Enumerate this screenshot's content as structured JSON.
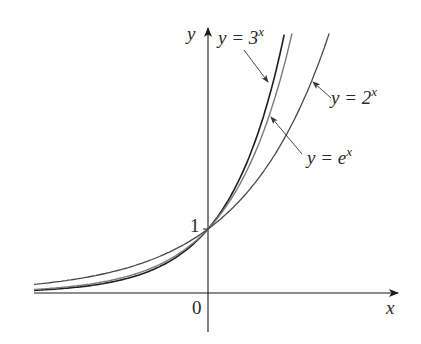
{
  "chart_data": {
    "type": "line",
    "title": "",
    "xlabel": "x",
    "ylabel": "y",
    "grid": false,
    "legend": "inline annotations with arrows",
    "tick_labels": {
      "x": [
        "0"
      ],
      "y": [
        "1"
      ]
    },
    "xlim": [
      -2.9,
      3.15
    ],
    "ylim": [
      -0.6,
      4.1
    ],
    "series": [
      {
        "name": "y = 3^x",
        "base": 3,
        "x": [
          -2.9,
          -2,
          -1,
          0,
          0.5,
          1,
          1.27
        ],
        "values": [
          0.04,
          0.11,
          0.33,
          1,
          1.73,
          3,
          4.03
        ]
      },
      {
        "name": "y = e^x",
        "base": 2.718281828,
        "x": [
          -2.9,
          -2,
          -1,
          0,
          0.5,
          1,
          1.4
        ],
        "values": [
          0.06,
          0.14,
          0.37,
          1,
          1.65,
          2.72,
          4.06
        ]
      },
      {
        "name": "y = 2^x",
        "base": 2,
        "x": [
          -2.9,
          -2,
          -1,
          0,
          1,
          1.5,
          2.02
        ],
        "values": [
          0.13,
          0.25,
          0.5,
          1,
          2,
          2.83,
          4.06
        ]
      }
    ],
    "annotations": [
      {
        "text_main": "y = 3",
        "exp": "x",
        "points_to": "y = 3^x"
      },
      {
        "text_main": "y = e",
        "exp": "x",
        "points_to": "y = e^x"
      },
      {
        "text_main": "y = 2",
        "exp": "x",
        "points_to": "y = 2^x"
      }
    ]
  },
  "labels": {
    "x_axis": "x",
    "y_axis": "y",
    "origin": "0",
    "one": "1",
    "l3_main": "y = 3",
    "l3_exp": "x",
    "le_main": "y = e",
    "le_exp": "x",
    "l2_main": "y = 2",
    "l2_exp": "x"
  }
}
